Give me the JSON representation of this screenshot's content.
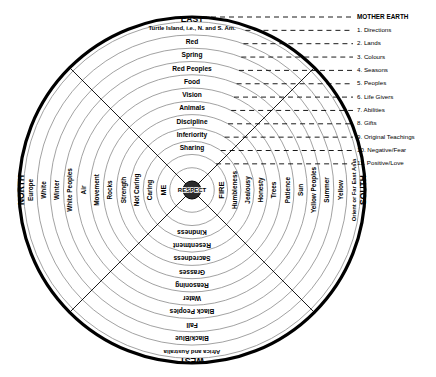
{
  "center": {
    "hub_label": "RESPECT"
  },
  "directions": {
    "east": "EAST",
    "north": "NORTH",
    "south": "SOUTH",
    "west": "WEST"
  },
  "legend": {
    "outer_label": "MOTHER EARTH",
    "items": [
      "1. Directions",
      "2. Lands",
      "3. Colours",
      "4. Seasons",
      "5. Peoples",
      "6. Life Givers",
      "7. Abilities",
      "8. Gifts",
      "9. Original Teachings",
      "10. Negative/Fear",
      "11. Positive/Love"
    ]
  },
  "quadrants": {
    "east": {
      "direction": "EAST",
      "rings": [
        "Turtle Island, i.e., N. and S. Am.",
        "Red",
        "Spring",
        "Red Peoples",
        "Food",
        "Vision",
        "Animals",
        "Discipline",
        "Inferiority",
        "Sharing",
        "FIRE"
      ]
    },
    "north": {
      "direction": "NORTH",
      "rings": [
        "Europe",
        "White",
        "Winter",
        "White Peoples",
        "Air",
        "Movement",
        "Rocks",
        "Strength",
        "Not Caring",
        "Caring",
        "ME"
      ]
    },
    "south": {
      "direction": "SOUTH",
      "rings": [
        "Orient or Far East Asia",
        "Yellow",
        "Summer",
        "Yellow Peoples",
        "Sun",
        "Patience",
        "Trees",
        "Honesty",
        "Jealousy",
        "Humbleness",
        "FIRE"
      ]
    },
    "west": {
      "direction": "WEST",
      "rings": [
        "Africa and Australia",
        "Black/Blue",
        "Fall",
        "Black Peoples",
        "Water",
        "Reasoning",
        "Grasses",
        "Sacredness",
        "Resentment",
        "Kindness"
      ]
    }
  },
  "colors": {
    "ink": "#000000",
    "ring_line": "#8a8a8a",
    "background": "#ffffff"
  }
}
